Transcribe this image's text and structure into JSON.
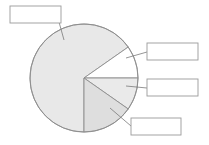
{
  "figure": {
    "kind": "pie-chart-with-callouts",
    "width": 209,
    "height": 145,
    "background_color": "#ffffff",
    "stroke_color": "#8d8d8d",
    "leader_line_color": "#7a7a7a"
  },
  "chart_data": {
    "type": "pie",
    "title": "",
    "subtitle": "",
    "xlabel": "",
    "ylabel": "",
    "grid": false,
    "legend_position": "callout-boxes",
    "center": {
      "x": 84,
      "y": 78
    },
    "radius": 54,
    "start_angle_deg": -35,
    "direction": "counterclockwise",
    "categories": [
      "Slice 1",
      "Slice 2",
      "Slice 3",
      "Slice 4"
    ],
    "values": [
      72.2,
      9.7,
      9.7,
      15.3
    ],
    "units": "percent",
    "slices": [
      {
        "name": "Slice 1",
        "value": 72.2,
        "start_angle_deg": 90,
        "end_angle_deg": 325,
        "fill": "#e8e8e8",
        "stroke": "#8d8d8d",
        "label": ""
      },
      {
        "name": "Slice 2",
        "value": 9.7,
        "start_angle_deg": 325,
        "end_angle_deg": 360,
        "fill": "#ffffff",
        "stroke": "#8d8d8d",
        "label": ""
      },
      {
        "name": "Slice 3",
        "value": 9.7,
        "start_angle_deg": 0,
        "end_angle_deg": 35,
        "fill": "#eaeaea",
        "stroke": "#8d8d8d",
        "label": ""
      },
      {
        "name": "Slice 4",
        "value": 15.3,
        "start_angle_deg": 35,
        "end_angle_deg": 90,
        "fill": "#dedede",
        "stroke": "#8d8d8d",
        "label": ""
      }
    ]
  },
  "callouts": [
    {
      "id": "callout-top-left",
      "label": "",
      "placeholder": "",
      "box": {
        "x": 10,
        "y": 6,
        "w": 51,
        "h": 17
      },
      "fill": "#ffffff",
      "stroke": "#9a9a9a",
      "leader": {
        "x1": 59,
        "y1": 22,
        "x2": 64,
        "y2": 40
      },
      "points_to": "Slice 1"
    },
    {
      "id": "callout-right-upper",
      "label": "",
      "placeholder": "",
      "box": {
        "x": 147,
        "y": 43,
        "w": 51,
        "h": 17
      },
      "fill": "#ffffff",
      "stroke": "#9a9a9a",
      "leader": {
        "x1": 147,
        "y1": 52,
        "x2": 126,
        "y2": 58
      },
      "points_to": "Slice 2"
    },
    {
      "id": "callout-right-lower",
      "label": "",
      "placeholder": "",
      "box": {
        "x": 147,
        "y": 79,
        "w": 51,
        "h": 17
      },
      "fill": "#ffffff",
      "stroke": "#9a9a9a",
      "leader": {
        "x1": 147,
        "y1": 88,
        "x2": 126,
        "y2": 86
      },
      "points_to": "Slice 3"
    },
    {
      "id": "callout-bottom-right",
      "label": "",
      "placeholder": "",
      "box": {
        "x": 131,
        "y": 118,
        "w": 50,
        "h": 17
      },
      "fill": "#ffffff",
      "stroke": "#9a9a9a",
      "leader": {
        "x1": 131,
        "y1": 126,
        "x2": 110,
        "y2": 108
      },
      "points_to": "Slice 4"
    }
  ]
}
